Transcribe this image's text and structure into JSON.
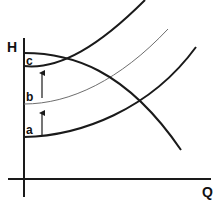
{
  "diagram": {
    "type": "pump-system-curves",
    "axes": {
      "y_label": "H",
      "x_label": "Q"
    },
    "curves": [
      {
        "id": "pump-curve",
        "description": "pump head curve (falling)"
      },
      {
        "id": "system-curve-a",
        "label": "a"
      },
      {
        "id": "system-curve-b",
        "label": "b"
      },
      {
        "id": "system-curve-c",
        "label": "c"
      }
    ],
    "arrows": [
      {
        "from": "a",
        "to": "b"
      },
      {
        "from": "b",
        "to": "c"
      }
    ],
    "colors": {
      "line": "#1a1a1a",
      "thin_line": "#6e6e6e",
      "background": "#ffffff"
    }
  }
}
